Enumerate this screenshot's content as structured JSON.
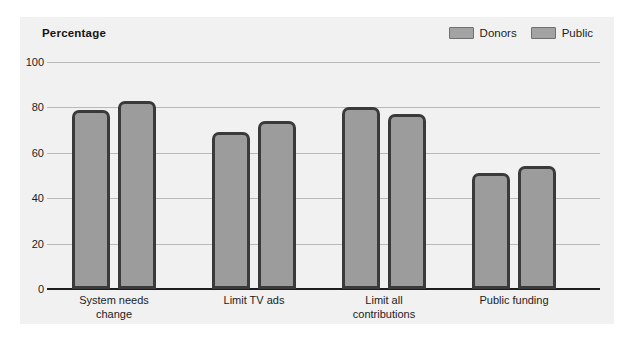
{
  "chart_data": {
    "type": "bar",
    "title": "Percentage",
    "xlabel": "",
    "ylabel": "Percentage",
    "ylim": [
      0,
      100
    ],
    "yticks": [
      0,
      20,
      40,
      60,
      80,
      100
    ],
    "grid": true,
    "legend_position": "top-right",
    "categories": [
      "System needs change",
      "Limit TV ads",
      "Limit all contributions",
      "Public funding"
    ],
    "category_lines": [
      [
        "System needs",
        "change"
      ],
      [
        "Limit TV ads"
      ],
      [
        "Limit all",
        "contributions"
      ],
      [
        "Public funding"
      ]
    ],
    "series": [
      {
        "name": "Donors",
        "values": [
          79,
          69,
          80,
          51
        ]
      },
      {
        "name": "Public",
        "values": [
          83,
          74,
          77,
          54
        ]
      }
    ],
    "colors": {
      "bar_fill": "#9c9c9c",
      "bar_border": "#3a3a3a",
      "panel_background": "#f1f1f1",
      "gridline": "#b9b9b9",
      "axis": "#1d1d1d",
      "text": "#1c1c1c"
    }
  },
  "legend": {
    "entries": [
      {
        "label": "Donors"
      },
      {
        "label": "Public"
      }
    ]
  }
}
